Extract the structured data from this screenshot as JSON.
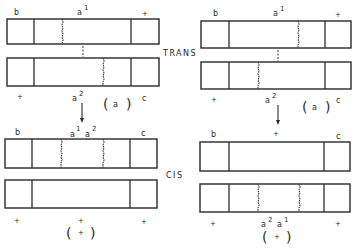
{
  "diagram": {
    "labels": {
      "trans": "TRANS",
      "cis": "CIS"
    },
    "panels": [
      {
        "id": "top-left",
        "top_labels": {
          "left": "b",
          "mid": "a",
          "mid_sup": "1",
          "right": "+"
        },
        "bottom_labels": {
          "left": "+",
          "mid": "a",
          "mid_sup": "2",
          "right": "c"
        },
        "phenotype": "a"
      },
      {
        "id": "top-right",
        "top_labels": {
          "left": "b",
          "mid": "a",
          "mid_sup": "1",
          "right": "+"
        },
        "bottom_labels": {
          "left": "+",
          "mid": "a",
          "mid_sup": "2",
          "right": "c"
        },
        "phenotype": "a"
      },
      {
        "id": "bottom-left",
        "top_labels": {
          "left": "b",
          "mid1": "a",
          "mid1_sup": "1",
          "mid2": "a",
          "mid2_sup": "2",
          "right": "c"
        },
        "bottom_labels": {
          "left": "+",
          "mid": "+",
          "right": "+"
        },
        "phenotype": "+"
      },
      {
        "id": "bottom-right",
        "top_labels": {
          "left": "b",
          "mid": "+",
          "right": "c"
        },
        "bottom_labels": {
          "left": "+",
          "mid1": "a",
          "mid1_sup": "2",
          "mid2": "a",
          "mid2_sup": "1",
          "right": "+"
        },
        "phenotype": "+"
      }
    ],
    "colors": {
      "line": "#2a2a2a",
      "background": "#ffffff"
    }
  }
}
